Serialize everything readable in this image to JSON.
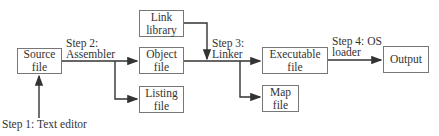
{
  "boxes": {
    "source": "Source file",
    "link_library": "Link library",
    "object": "Object file",
    "listing": "Listing file",
    "executable": "Executable file",
    "map": "Map file",
    "output": "Output"
  },
  "steps": {
    "step1": "Step 1: Text editor",
    "step2_line1": "Step 2:",
    "step2_line2": "Assembler",
    "step3_line1": "Step 3:",
    "step3_line2": "Linker",
    "step4_line1": "Step 4: OS",
    "step4_line2": "loader"
  },
  "colors": {
    "line": "#333333",
    "box_border": "#777777"
  }
}
